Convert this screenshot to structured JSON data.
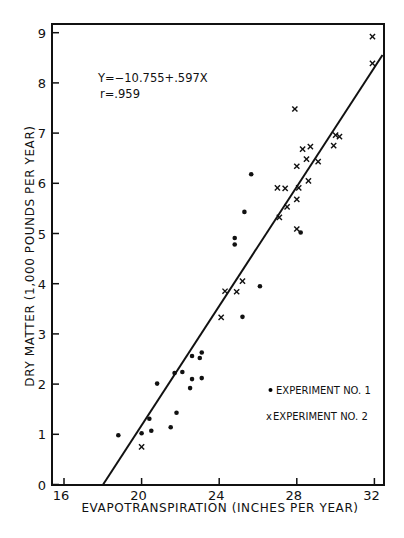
{
  "chart_data": {
    "type": "scatter",
    "title": "",
    "xlabel": "EVAPOTRANSPIRATION (INCHES PER YEAR)",
    "ylabel": "DRY MATTER (1,000 POUNDS PER YEAR)",
    "xlim": [
      15.4,
      32.5
    ],
    "ylim": [
      0,
      9.2
    ],
    "xticks": [
      16,
      20,
      24,
      28,
      32
    ],
    "yticks": [
      0,
      1,
      2,
      3,
      4,
      5,
      6,
      7,
      8,
      9
    ],
    "grid": false,
    "legend_position": "lower right",
    "annotations": {
      "equation": "Y=-10.755+.597X",
      "r": "r=.959"
    },
    "regression": {
      "intercept": -10.755,
      "slope": 0.597,
      "x_start": 18.0,
      "x_end": 32.5
    },
    "series": [
      {
        "name": "EXPERIMENT NO. 1",
        "marker": "dot",
        "points": [
          [
            18.8,
            0.98
          ],
          [
            20.0,
            1.02
          ],
          [
            20.5,
            1.07
          ],
          [
            20.4,
            1.31
          ],
          [
            21.5,
            1.14
          ],
          [
            21.8,
            1.43
          ],
          [
            20.8,
            2.01
          ],
          [
            21.7,
            2.22
          ],
          [
            22.1,
            2.24
          ],
          [
            22.5,
            1.92
          ],
          [
            22.6,
            2.1
          ],
          [
            23.1,
            2.12
          ],
          [
            22.6,
            2.56
          ],
          [
            23.0,
            2.52
          ],
          [
            23.1,
            2.63
          ],
          [
            25.3,
            5.43
          ],
          [
            24.8,
            4.91
          ],
          [
            24.8,
            4.78
          ],
          [
            25.65,
            6.18
          ],
          [
            26.1,
            3.95
          ],
          [
            25.2,
            3.34
          ],
          [
            28.2,
            5.02
          ]
        ]
      },
      {
        "name": "EXPERIMENT NO. 2",
        "marker": "x",
        "points": [
          [
            20.0,
            0.75
          ],
          [
            24.1,
            3.33
          ],
          [
            24.3,
            3.85
          ],
          [
            24.9,
            3.84
          ],
          [
            25.2,
            4.05
          ],
          [
            27.0,
            5.91
          ],
          [
            27.4,
            5.9
          ],
          [
            28.1,
            5.91
          ],
          [
            28.0,
            5.68
          ],
          [
            27.5,
            5.53
          ],
          [
            27.1,
            5.32
          ],
          [
            28.0,
            5.09
          ],
          [
            28.6,
            6.05
          ],
          [
            28.0,
            6.34
          ],
          [
            28.5,
            6.48
          ],
          [
            29.1,
            6.43
          ],
          [
            28.3,
            6.68
          ],
          [
            28.7,
            6.73
          ],
          [
            29.9,
            6.75
          ],
          [
            30.0,
            6.96
          ],
          [
            30.2,
            6.93
          ],
          [
            27.9,
            7.48
          ],
          [
            31.9,
            8.39
          ],
          [
            31.9,
            8.92
          ]
        ]
      }
    ]
  },
  "legend": {
    "exp1": "EXPERIMENT NO. 1",
    "exp2": "EXPERIMENT NO. 2",
    "exp1_marker": "•",
    "exp2_marker": "x"
  },
  "annotation": {
    "equation": "Y=−10.755+.597X",
    "r": "r=.959"
  },
  "axes": {
    "xlabel": "EVAPOTRANSPIRATION (INCHES PER YEAR)",
    "ylabel": "DRY MATTER (1,000 POUNDS PER YEAR)"
  }
}
